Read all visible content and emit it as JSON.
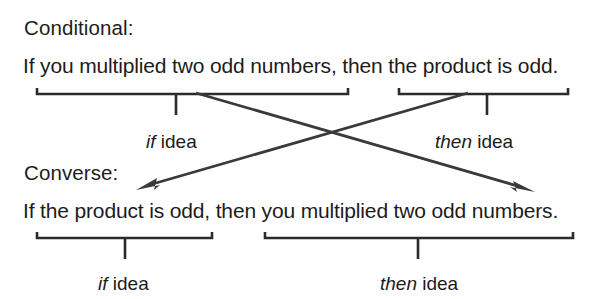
{
  "diagram": {
    "title_text": "Conditional and Converse statement diagram",
    "rows": [
      {
        "heading": "Conditional:",
        "sentence": "If you multiplied two odd numbers, then the product is odd.",
        "if_label_keyword": "if",
        "if_label_rest": " idea",
        "then_label_keyword": "then",
        "then_label_rest": " idea"
      },
      {
        "heading": "Converse:",
        "sentence": "If the product is odd, then you multiplied two odd numbers.",
        "if_label_keyword": "if",
        "if_label_rest": " idea",
        "then_label_keyword": "then",
        "then_label_rest": " idea"
      }
    ],
    "colors": {
      "text": "#1c1c1c",
      "bracket": "#2b2b2b",
      "arrow": "#3a3a3a",
      "background": "#ffffff"
    }
  }
}
